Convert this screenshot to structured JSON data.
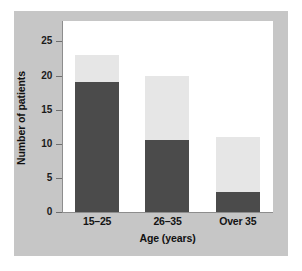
{
  "chart_data": {
    "type": "bar",
    "title": "",
    "subtitle": "",
    "xlabel": "Age (years)",
    "ylabel": "Number of patients",
    "categories": [
      "15–25",
      "26–35",
      "Over 35"
    ],
    "stacked": true,
    "series": [
      {
        "name": "dark-segment",
        "color": "#4b4b4b",
        "values": [
          19,
          10.5,
          3
        ]
      },
      {
        "name": "light-segment",
        "color": "#e6e6e6",
        "values": [
          4,
          9.5,
          8
        ]
      }
    ],
    "totals": [
      23,
      20,
      11
    ],
    "ylim": [
      0,
      28
    ],
    "yticks": [
      0,
      5,
      10,
      15,
      20,
      25
    ],
    "ytick_labels": [
      "0",
      "5",
      "10",
      "15",
      "20",
      "25"
    ],
    "grid": false,
    "legend": null,
    "annotations": []
  },
  "figure": {
    "background_color": "#ffffff",
    "panel_color": "#c6c6c6",
    "plot_color": "#ffffff",
    "axis_color": "#8d8d8d",
    "text_color": "#111111"
  }
}
